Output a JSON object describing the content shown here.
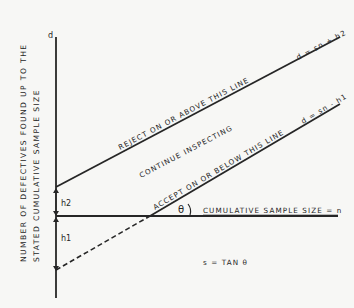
{
  "diagram": {
    "title": "",
    "y_axis": {
      "symbol": "d",
      "label_line1": "NUMBER OF DEFECTIVES FOUND UP TO THE",
      "label_line2": "STATED CUMULATIVE SAMPLE SIZE"
    },
    "x_axis": {
      "label": "CUMULATIVE SAMPLE SIZE = n"
    },
    "lines": {
      "reject": {
        "label": "REJECT ON OR ABOVE THIS LINE",
        "equation": "d = sn + h2"
      },
      "accept": {
        "label": "ACCEPT ON OR BELOW THIS LINE",
        "equation": "d = sn - h1"
      }
    },
    "region_label": "CONTINUE INSPECTING",
    "intercepts": {
      "h2": "h2",
      "h1": "h1"
    },
    "angle": {
      "symbol": "θ",
      "formula": "s = TAN θ"
    },
    "colors": {
      "ink": "#262626",
      "paper": "#f7f7f5"
    }
  }
}
